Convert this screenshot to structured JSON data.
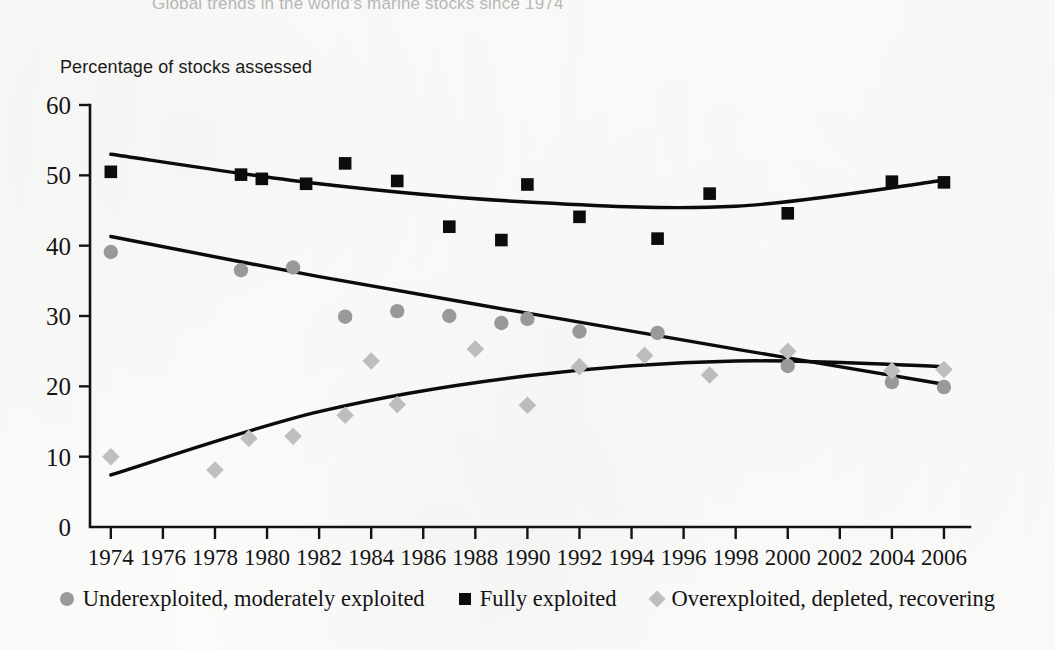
{
  "chart_title": "Global trends in the world's marine stocks since 1974",
  "axis_label_y": "Percentage of stocks assessed",
  "legend": [
    {
      "label": "Underexploited, moderately exploited",
      "marker": "circle",
      "color": "#9b9b9b",
      "icon_name": "legend-circle-marker-icon"
    },
    {
      "label": "Fully exploited",
      "marker": "square",
      "color": "#0c0c0c",
      "icon_name": "legend-square-marker-icon"
    },
    {
      "label": "Overexploited, depleted, recovering",
      "marker": "diamond",
      "color": "#c0c0c0",
      "icon_name": "legend-diamond-marker-icon"
    }
  ],
  "chart_data": {
    "type": "scatter",
    "title": "Global trends in the world's marine stocks since 1974",
    "subtitle": "",
    "xlabel": "",
    "ylabel": "Percentage of stocks assessed",
    "xlim": [
      1973.2,
      2007.0
    ],
    "ylim": [
      0,
      60
    ],
    "grid": false,
    "legend_position": "bottom-center",
    "ytick_labels": [
      "0",
      "10",
      "20",
      "30",
      "40",
      "50",
      "60"
    ],
    "yticks": [
      0,
      10,
      20,
      30,
      40,
      50,
      60
    ],
    "xtick_labels": [
      "1974",
      "1976",
      "1978",
      "1980",
      "1982",
      "1984",
      "1986",
      "1988",
      "1990",
      "1992",
      "1994",
      "1996",
      "1998",
      "2000",
      "2002",
      "2004",
      "2006"
    ],
    "xticks": [
      1974,
      1976,
      1978,
      1980,
      1982,
      1984,
      1986,
      1988,
      1990,
      1992,
      1994,
      1996,
      1998,
      2000,
      2002,
      2004,
      2006
    ],
    "series": [
      {
        "name": "Underexploited, moderately exploited",
        "marker": "circle",
        "color": "#9b9b9b",
        "points": [
          {
            "x": 1974,
            "y": 39.1
          },
          {
            "x": 1979,
            "y": 36.5
          },
          {
            "x": 1981,
            "y": 36.9
          },
          {
            "x": 1983,
            "y": 29.9
          },
          {
            "x": 1985,
            "y": 30.7
          },
          {
            "x": 1987,
            "y": 30.0
          },
          {
            "x": 1989,
            "y": 29.0
          },
          {
            "x": 1990,
            "y": 29.6
          },
          {
            "x": 1992,
            "y": 27.8
          },
          {
            "x": 1995,
            "y": 27.6
          },
          {
            "x": 2000,
            "y": 22.9
          },
          {
            "x": 2004,
            "y": 20.6
          },
          {
            "x": 2006,
            "y": 19.9
          }
        ],
        "trend": [
          {
            "x": 1974,
            "y": 41.3
          },
          {
            "x": 1982,
            "y": 35.6
          },
          {
            "x": 1990,
            "y": 30.4
          },
          {
            "x": 1998,
            "y": 25.3
          },
          {
            "x": 2006,
            "y": 20.3
          }
        ]
      },
      {
        "name": "Fully exploited",
        "marker": "square",
        "color": "#0c0c0c",
        "points": [
          {
            "x": 1974,
            "y": 50.5
          },
          {
            "x": 1979,
            "y": 50.1
          },
          {
            "x": 1979.8,
            "y": 49.5
          },
          {
            "x": 1981.5,
            "y": 48.8
          },
          {
            "x": 1983,
            "y": 51.7
          },
          {
            "x": 1985,
            "y": 49.2
          },
          {
            "x": 1987,
            "y": 42.7
          },
          {
            "x": 1989,
            "y": 40.8
          },
          {
            "x": 1990,
            "y": 48.7
          },
          {
            "x": 1992,
            "y": 44.1
          },
          {
            "x": 1995,
            "y": 41.0
          },
          {
            "x": 1997,
            "y": 47.4
          },
          {
            "x": 2000,
            "y": 44.6
          },
          {
            "x": 2004,
            "y": 49.1
          },
          {
            "x": 2006,
            "y": 49.0
          }
        ],
        "trend": [
          {
            "x": 1974,
            "y": 53.0
          },
          {
            "x": 1982,
            "y": 48.8
          },
          {
            "x": 1990,
            "y": 46.2
          },
          {
            "x": 1998,
            "y": 45.6
          },
          {
            "x": 2006,
            "y": 49.3
          }
        ]
      },
      {
        "name": "Overexploited, depleted, recovering",
        "marker": "diamond",
        "color": "#c0c0c0",
        "points": [
          {
            "x": 1974,
            "y": 10.0
          },
          {
            "x": 1978,
            "y": 8.1
          },
          {
            "x": 1979.3,
            "y": 12.6
          },
          {
            "x": 1981,
            "y": 12.9
          },
          {
            "x": 1983,
            "y": 15.9
          },
          {
            "x": 1984,
            "y": 23.6
          },
          {
            "x": 1985,
            "y": 17.4
          },
          {
            "x": 1988,
            "y": 25.3
          },
          {
            "x": 1990,
            "y": 17.3
          },
          {
            "x": 1992,
            "y": 22.8
          },
          {
            "x": 1994.5,
            "y": 24.4
          },
          {
            "x": 1997,
            "y": 21.6
          },
          {
            "x": 2000,
            "y": 25.0
          },
          {
            "x": 2004,
            "y": 22.2
          },
          {
            "x": 2006,
            "y": 22.4
          }
        ],
        "trend": [
          {
            "x": 1974,
            "y": 7.4
          },
          {
            "x": 1982,
            "y": 16.4
          },
          {
            "x": 1990,
            "y": 21.5
          },
          {
            "x": 1998,
            "y": 23.6
          },
          {
            "x": 2006,
            "y": 22.8
          }
        ]
      }
    ]
  }
}
